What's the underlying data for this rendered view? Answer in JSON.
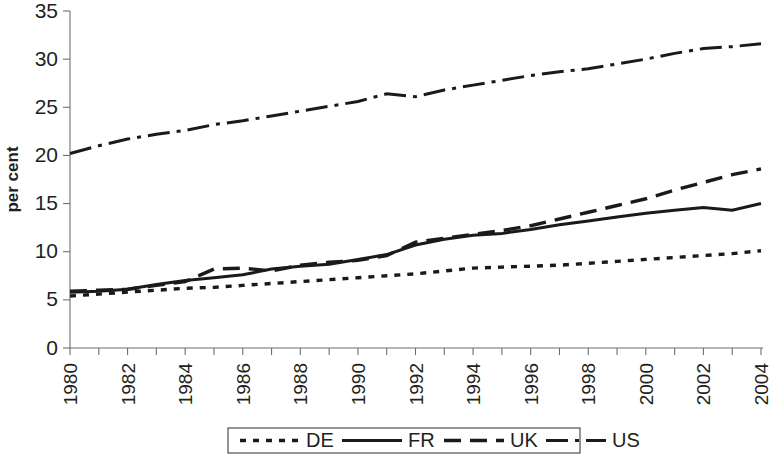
{
  "chart_data": {
    "type": "line",
    "title": "",
    "subtitle": "",
    "xlabel": "",
    "ylabel": "per cent",
    "xlim": [
      1980,
      2004
    ],
    "ylim": [
      0,
      35
    ],
    "ytick_step": 5,
    "grid": false,
    "legend_position": "bottom",
    "x": [
      1980,
      1981,
      1982,
      1983,
      1984,
      1985,
      1986,
      1987,
      1988,
      1989,
      1990,
      1991,
      1992,
      1993,
      1994,
      1995,
      1996,
      1997,
      1998,
      1999,
      2000,
      2001,
      2002,
      2003,
      2004
    ],
    "xtick_labels": [
      "1980",
      "",
      "1982",
      "",
      "1984",
      "",
      "1986",
      "",
      "1988",
      "",
      "1990",
      "",
      "1992",
      "",
      "1994",
      "",
      "1996",
      "",
      "1998",
      "",
      "2000",
      "",
      "2002",
      "",
      "2004"
    ],
    "ytick_labels": [
      "0",
      "5",
      "10",
      "15",
      "20",
      "25",
      "30",
      "35"
    ],
    "series": [
      {
        "name": "DE",
        "dash": "dotted",
        "values": [
          5.4,
          5.6,
          5.8,
          6.0,
          6.2,
          6.3,
          6.5,
          6.7,
          6.9,
          7.1,
          7.3,
          7.5,
          7.7,
          8.0,
          8.3,
          8.4,
          8.5,
          8.6,
          8.8,
          9.0,
          9.2,
          9.4,
          9.6,
          9.8,
          10.1
        ]
      },
      {
        "name": "FR",
        "dash": "solid",
        "values": [
          5.8,
          5.9,
          6.1,
          6.6,
          7.0,
          7.3,
          7.6,
          8.2,
          8.5,
          8.7,
          9.2,
          9.7,
          10.7,
          11.3,
          11.7,
          11.9,
          12.3,
          12.8,
          13.2,
          13.6,
          14.0,
          14.3,
          14.6,
          14.3,
          15.0
        ]
      },
      {
        "name": "UK",
        "dash": "dashed",
        "values": [
          5.9,
          6.0,
          6.1,
          6.5,
          6.9,
          8.2,
          8.3,
          8.0,
          8.6,
          8.9,
          9.1,
          9.6,
          11.0,
          11.4,
          11.8,
          12.2,
          12.7,
          13.4,
          14.1,
          14.8,
          15.5,
          16.4,
          17.2,
          18.0,
          18.6
        ]
      },
      {
        "name": "US",
        "dash": "dashdot",
        "values": [
          20.2,
          21.0,
          21.7,
          22.2,
          22.6,
          23.2,
          23.6,
          24.1,
          24.6,
          25.1,
          25.6,
          26.4,
          26.1,
          26.8,
          27.3,
          27.8,
          28.3,
          28.7,
          29.0,
          29.5,
          30.0,
          30.6,
          31.1,
          31.3,
          31.6
        ]
      }
    ]
  },
  "legend": {
    "items": [
      {
        "label": "DE",
        "dash": "dotted"
      },
      {
        "label": "FR",
        "dash": "solid"
      },
      {
        "label": "UK",
        "dash": "dashed"
      },
      {
        "label": "US",
        "dash": "dashdot"
      }
    ]
  },
  "axes": {
    "y_title": "per cent"
  }
}
